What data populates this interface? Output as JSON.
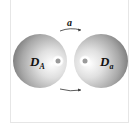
{
  "diagram": {
    "type": "two-sphere interaction schematic",
    "top_arrow_label": "a",
    "left_sphere": {
      "label_main": "D",
      "label_sub": "A"
    },
    "right_sphere": {
      "label_main": "D",
      "label_sub": "a"
    },
    "arrows": [
      {
        "position": "top",
        "direction": "left-to-right",
        "label": "a"
      },
      {
        "position": "bottom",
        "direction": "left-to-right",
        "label": ""
      }
    ],
    "colors": {
      "sphere_highlight": "#ffffff",
      "sphere_mid": "#bdbdbd",
      "sphere_edge": "#7a7a7a",
      "dot": "#9a9a9a",
      "frame": "#e6e6e6",
      "text": "#111111"
    }
  }
}
